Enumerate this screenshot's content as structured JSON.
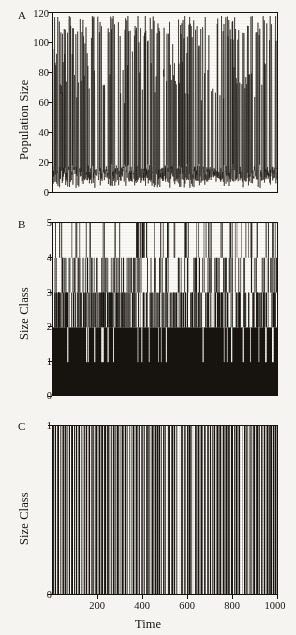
{
  "figure": {
    "background_color": "#f6f4f0",
    "ink_color": "#17140f",
    "xlabel": "Time"
  },
  "chart_data": [
    {
      "type": "line",
      "panel": "A",
      "title": "",
      "xlabel": "",
      "ylabel": "Population Size",
      "xlim": [
        0,
        1000
      ],
      "ylim": [
        0,
        120
      ],
      "xticks": [
        200,
        400,
        600,
        800,
        1000
      ],
      "xticklabels": [
        "",
        "",
        "",
        "",
        ""
      ],
      "yticks": [
        0,
        20,
        40,
        60,
        80,
        100,
        120
      ],
      "yticklabels": [
        "0",
        "20",
        "40",
        "60",
        "80",
        "100",
        "120"
      ],
      "grid": false,
      "legend": "none",
      "description": "Chaotic population time series oscillating between about 5 and 118 with irregular tall spikes reaching 100-118 and a dense low band between 8 and 40.",
      "series": [
        {
          "name": "population size",
          "sampling": "one value per unit time, 1000 points",
          "baseline_band": [
            8,
            40
          ],
          "spike_range": [
            95,
            118
          ],
          "mean": 28,
          "values_summary": "chaotic attractor; roughly 55 large outbreaks above 90 across t=0..1000"
        }
      ]
    },
    {
      "type": "line",
      "panel": "B",
      "title": "",
      "xlabel": "",
      "ylabel": "Size Class",
      "xlim": [
        0,
        1000
      ],
      "ylim": [
        0,
        5
      ],
      "xticks": [
        200,
        400,
        600,
        800,
        1000
      ],
      "xticklabels": [
        "",
        "",
        "",
        "",
        ""
      ],
      "yticks": [
        0,
        1,
        2,
        3,
        4,
        5
      ],
      "yticklabels": [
        "0",
        "1",
        "2",
        "3",
        "4",
        "5"
      ],
      "grid": false,
      "legend": "none",
      "description": "Size class trajectory filling solid black below class 2, very dense vertical excursions between 2 and 3, moderately dense between 3 and 4, and sparse isolated spikes reaching class 5; occasional downward spikes to class 1.",
      "series": [
        {
          "name": "size class",
          "fill_level": 2,
          "dense_band": [
            2,
            3
          ],
          "medium_band": [
            3,
            4
          ],
          "sparse_band": [
            4,
            5
          ],
          "min": 1,
          "max": 5
        }
      ]
    },
    {
      "type": "line",
      "panel": "C",
      "title": "",
      "xlabel": "Time",
      "ylabel": "Size Class",
      "xlim": [
        0,
        1000
      ],
      "ylim": [
        0,
        1
      ],
      "xticks": [
        200,
        400,
        600,
        800,
        1000
      ],
      "xticklabels": [
        "200",
        "400",
        "600",
        "800",
        "1000"
      ],
      "yticks": [
        0,
        1
      ],
      "yticklabels": [
        "0",
        "1"
      ],
      "grid": false,
      "legend": "none",
      "description": "Single size class switching rapidly between 0 and 1 producing a dense barcode of full-height vertical lines with a conspicuous white gap near t = 550 and smaller gaps near t = 120, 330, 500, 620 and 830.",
      "series": [
        {
          "name": "size class",
          "min": 0,
          "max": 1,
          "gaps_at_time": [
            120,
            330,
            500,
            550,
            620,
            830
          ]
        }
      ]
    }
  ],
  "panels": [
    {
      "letter": "A",
      "ylabel": "Population Size",
      "yticklabels": [
        "120",
        "100",
        "80",
        "60",
        "40",
        "20",
        "0"
      ]
    },
    {
      "letter": "B",
      "ylabel": "Size Class",
      "yticklabels": [
        "5",
        "4",
        "3",
        "2",
        "1",
        "0"
      ]
    },
    {
      "letter": "C",
      "ylabel": "Size Class",
      "yticklabels": [
        "1",
        "0"
      ],
      "xticklabels": [
        "200",
        "400",
        "600",
        "800",
        "1000"
      ]
    }
  ]
}
